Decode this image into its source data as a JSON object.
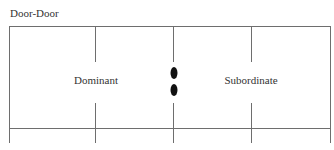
{
  "diagram": {
    "title": "Door-Door",
    "regions": [
      {
        "label": "Dominant"
      },
      {
        "label": "Subordinate"
      }
    ],
    "separator": {
      "marks": 2,
      "shape": "oval",
      "color": "#111111"
    },
    "line_color": "#6e6e6e"
  }
}
